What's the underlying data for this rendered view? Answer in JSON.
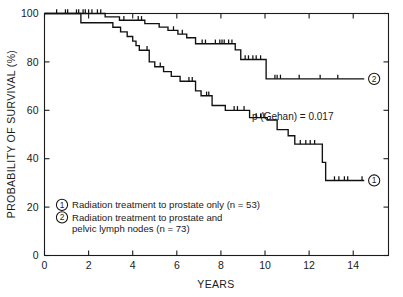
{
  "chart_data": {
    "type": "line",
    "subtype": "kaplan-meier-step",
    "title": "",
    "xlabel": "YEARS",
    "ylabel": "PROBABILITY OF SURVIVAL (%)",
    "xlim": [
      0,
      15.6
    ],
    "ylim": [
      0,
      100
    ],
    "grid": false,
    "xticks": [
      0,
      2,
      4,
      6,
      8,
      10,
      12,
      14
    ],
    "xtick_labels": [
      "0",
      "2",
      "4",
      "6",
      "8",
      "10",
      "12",
      "14"
    ],
    "yticks": [
      0,
      20,
      40,
      60,
      80,
      100
    ],
    "ytick_labels": [
      "0",
      "20",
      "40",
      "60",
      "80",
      "100"
    ],
    "annotations": [
      {
        "name": "p-value",
        "text": "p (Gehan)  =  0.017",
        "x": 10.15,
        "y": 64.5
      }
    ],
    "legend_position": "inside-lower-left",
    "series": [
      {
        "id": 1,
        "name": "Radiation treatment to prostate only (n = 53)",
        "marker_label": "1",
        "n": 53,
        "end_label_x": 14.95,
        "end_label_y": 31.0,
        "steps": [
          [
            0.0,
            100.0
          ],
          [
            1.65,
            100.0
          ],
          [
            1.65,
            96.2
          ],
          [
            3.1,
            96.2
          ],
          [
            3.1,
            94.3
          ],
          [
            3.45,
            94.3
          ],
          [
            3.45,
            92.4
          ],
          [
            3.75,
            92.4
          ],
          [
            3.75,
            90.5
          ],
          [
            4.0,
            90.5
          ],
          [
            4.0,
            88.6
          ],
          [
            4.15,
            88.6
          ],
          [
            4.15,
            86.7
          ],
          [
            4.3,
            86.7
          ],
          [
            4.3,
            84.8
          ],
          [
            4.75,
            84.8
          ],
          [
            4.75,
            80.0
          ],
          [
            5.0,
            80.0
          ],
          [
            5.0,
            78.0
          ],
          [
            5.4,
            78.0
          ],
          [
            5.4,
            76.0
          ],
          [
            5.75,
            76.0
          ],
          [
            5.75,
            74.0
          ],
          [
            6.15,
            74.0
          ],
          [
            6.15,
            72.0
          ],
          [
            6.85,
            72.0
          ],
          [
            6.85,
            68.0
          ],
          [
            7.1,
            68.0
          ],
          [
            7.1,
            66.0
          ],
          [
            7.6,
            66.0
          ],
          [
            7.6,
            62.0
          ],
          [
            8.2,
            62.0
          ],
          [
            8.2,
            60.0
          ],
          [
            9.3,
            60.0
          ],
          [
            9.3,
            57.0
          ],
          [
            10.1,
            57.0
          ],
          [
            10.1,
            56.0
          ],
          [
            10.55,
            56.0
          ],
          [
            10.55,
            52.0
          ],
          [
            11.05,
            52.0
          ],
          [
            11.05,
            49.5
          ],
          [
            11.35,
            49.5
          ],
          [
            11.35,
            46.0
          ],
          [
            12.6,
            46.0
          ],
          [
            12.6,
            38.5
          ],
          [
            12.75,
            38.5
          ],
          [
            12.75,
            31.0
          ],
          [
            14.5,
            31.0
          ]
        ],
        "censor_times": [
          [
            4.65,
            84.8
          ],
          [
            5.25,
            78.0
          ],
          [
            6.55,
            72.0
          ],
          [
            6.7,
            72.0
          ],
          [
            7.35,
            66.0
          ],
          [
            7.45,
            66.0
          ],
          [
            8.6,
            60.0
          ],
          [
            8.75,
            60.0
          ],
          [
            9.05,
            60.0
          ],
          [
            9.6,
            57.0
          ],
          [
            9.8,
            57.0
          ],
          [
            9.95,
            57.0
          ],
          [
            11.6,
            46.0
          ],
          [
            11.85,
            46.0
          ],
          [
            12.05,
            46.0
          ],
          [
            12.25,
            46.0
          ],
          [
            13.15,
            31.0
          ],
          [
            13.35,
            31.0
          ],
          [
            13.6,
            31.0
          ],
          [
            13.75,
            31.0
          ],
          [
            14.4,
            31.0
          ]
        ]
      },
      {
        "id": 2,
        "name": "Radiation treatment to prostate and pelvic lymph nodes (n = 73)",
        "marker_label": "2",
        "n": 73,
        "end_label_x": 14.95,
        "end_label_y": 73.0,
        "steps": [
          [
            0.0,
            100.0
          ],
          [
            2.75,
            100.0
          ],
          [
            2.75,
            98.6
          ],
          [
            3.4,
            98.6
          ],
          [
            3.4,
            97.2
          ],
          [
            4.55,
            97.2
          ],
          [
            4.55,
            95.8
          ],
          [
            5.2,
            95.8
          ],
          [
            5.2,
            94.4
          ],
          [
            5.6,
            94.4
          ],
          [
            5.6,
            93.0
          ],
          [
            6.05,
            93.0
          ],
          [
            6.05,
            91.5
          ],
          [
            6.45,
            91.5
          ],
          [
            6.45,
            90.0
          ],
          [
            6.85,
            90.0
          ],
          [
            6.85,
            87.5
          ],
          [
            8.65,
            87.5
          ],
          [
            8.65,
            85.0
          ],
          [
            8.9,
            85.0
          ],
          [
            8.9,
            81.0
          ],
          [
            10.05,
            81.0
          ],
          [
            10.05,
            73.0
          ],
          [
            14.5,
            73.0
          ]
        ],
        "censor_times": [
          [
            0.55,
            100.0
          ],
          [
            0.95,
            100.0
          ],
          [
            1.05,
            100.0
          ],
          [
            1.45,
            100.0
          ],
          [
            1.55,
            100.0
          ],
          [
            1.75,
            100.0
          ],
          [
            1.85,
            100.0
          ],
          [
            2.0,
            100.0
          ],
          [
            2.15,
            100.0
          ],
          [
            2.4,
            100.0
          ],
          [
            2.55,
            100.0
          ],
          [
            3.6,
            97.2
          ],
          [
            4.25,
            97.2
          ],
          [
            4.4,
            97.2
          ],
          [
            5.85,
            93.0
          ],
          [
            6.25,
            91.5
          ],
          [
            7.15,
            87.5
          ],
          [
            7.3,
            87.5
          ],
          [
            7.75,
            87.5
          ],
          [
            7.95,
            87.5
          ],
          [
            8.05,
            87.5
          ],
          [
            8.15,
            87.5
          ],
          [
            8.35,
            87.5
          ],
          [
            8.5,
            87.5
          ],
          [
            9.1,
            81.0
          ],
          [
            9.25,
            81.0
          ],
          [
            9.45,
            81.0
          ],
          [
            9.6,
            81.0
          ],
          [
            9.8,
            81.0
          ],
          [
            10.45,
            73.0
          ],
          [
            10.55,
            73.0
          ],
          [
            10.7,
            73.0
          ],
          [
            11.55,
            73.0
          ],
          [
            12.5,
            73.0
          ],
          [
            13.3,
            73.0
          ]
        ]
      }
    ]
  },
  "legend": {
    "entries": [
      {
        "marker": "1",
        "lines": [
          "Radiation treatment to prostate only (n  =  53)"
        ]
      },
      {
        "marker": "2",
        "lines": [
          "Radiation treatment to prostate and",
          "pelvic lymph nodes (n  =  73)"
        ]
      }
    ]
  },
  "axes": {
    "x_title": "YEARS",
    "y_title": "PROBABILITY OF SURVIVAL (%)",
    "x_tick_labels": [
      "0",
      "2",
      "4",
      "6",
      "8",
      "10",
      "12",
      "14"
    ],
    "y_tick_labels": [
      "100",
      "80",
      "60",
      "40",
      "20",
      "0"
    ]
  },
  "statistics": {
    "p_value_text": "p (Gehan)  =  0.017"
  },
  "colors": {
    "background": "#ffffff",
    "ink": "#111111",
    "axis": "#1b1b1b"
  }
}
